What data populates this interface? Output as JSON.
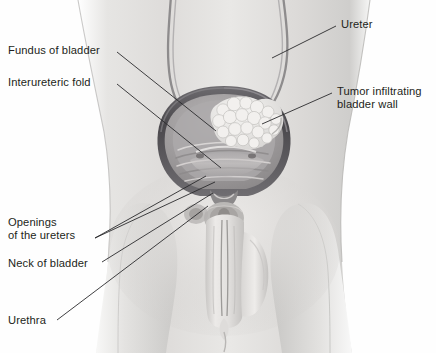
{
  "figure": {
    "style": "grayscale medical illustration",
    "width": 436,
    "height": 353
  },
  "colors": {
    "background": "#fefefe",
    "skin_light": "#e8e7e5",
    "skin_mid": "#d3d2d0",
    "skin_shadow": "#b9b8b6",
    "bladder_wall": "#58565a",
    "bladder_wall_dark": "#3b393d",
    "bladder_lumen": "#a9a7a8",
    "mucosa": "#c9c6c5",
    "tumor": "#efeeec",
    "tumor_shade": "#c6c4c2",
    "ureter": "#8d8b8c",
    "leader_line": "#2a2a2c",
    "text": "#231f20"
  },
  "labels": [
    {
      "id": "fundus",
      "text": "Fundus of bladder",
      "side": "left",
      "x": 8,
      "y": 44
    },
    {
      "id": "interureteric",
      "text": "Interureteric fold",
      "side": "left",
      "x": 8,
      "y": 76
    },
    {
      "id": "openings",
      "line1": "Openings",
      "line2": "of the ureters",
      "side": "left",
      "x": 8,
      "y": 216
    },
    {
      "id": "neck",
      "text": "Neck of bladder",
      "side": "left",
      "x": 8,
      "y": 257
    },
    {
      "id": "urethra",
      "text": "Urethra",
      "side": "left",
      "x": 8,
      "y": 314
    },
    {
      "id": "ureter",
      "text": "Ureter",
      "side": "right",
      "x": 341,
      "y": 18
    },
    {
      "id": "tumor",
      "line1": "Tumor infiltrating",
      "line2": "bladder wall",
      "side": "right",
      "x": 337,
      "y": 85
    }
  ],
  "leaders": [
    {
      "id": "leader-fundus",
      "from": [
        117,
        52
      ],
      "to": [
        216,
        131
      ]
    },
    {
      "id": "leader-interureteric",
      "from": [
        117,
        84
      ],
      "to": [
        221,
        168
      ]
    },
    {
      "id": "leader-openings-a",
      "from": [
        95,
        238
      ],
      "to": [
        206,
        176
      ]
    },
    {
      "id": "leader-openings-b",
      "from": [
        95,
        238
      ],
      "to": [
        215,
        182
      ]
    },
    {
      "id": "leader-neck",
      "from": [
        102,
        262
      ],
      "to": [
        213,
        193
      ]
    },
    {
      "id": "leader-urethra",
      "from": [
        57,
        320
      ],
      "to": [
        208,
        206
      ]
    },
    {
      "id": "leader-ureter",
      "from": [
        336,
        26
      ],
      "to": [
        272,
        58
      ]
    },
    {
      "id": "leader-tumor",
      "from": [
        332,
        93
      ],
      "to": [
        262,
        124
      ]
    }
  ],
  "anatomy": [
    {
      "id": "torso",
      "name": "lower abdomen and pelvis"
    },
    {
      "id": "thigh-left",
      "name": "left thigh"
    },
    {
      "id": "thigh-right",
      "name": "right thigh"
    },
    {
      "id": "bladder",
      "name": "urinary bladder, opened anteriorly"
    },
    {
      "id": "ureter-left",
      "name": "left ureter"
    },
    {
      "id": "ureter-right",
      "name": "right ureter"
    },
    {
      "id": "tumor-mass",
      "name": "papillary tumor mass on bladder wall"
    },
    {
      "id": "rugae",
      "name": "bladder mucosal folds"
    },
    {
      "id": "bladder-neck",
      "name": "neck of bladder"
    },
    {
      "id": "prostate",
      "name": "prostate gland"
    },
    {
      "id": "urethra-shaft",
      "name": "urethra within penis"
    },
    {
      "id": "penis",
      "name": "penis"
    },
    {
      "id": "scrotum",
      "name": "scrotum"
    }
  ]
}
